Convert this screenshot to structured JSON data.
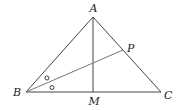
{
  "diagram": {
    "type": "geometry-triangle",
    "colors": {
      "stroke": "#444444",
      "label": "#222222",
      "background": "#ffffff"
    },
    "points": {
      "A": {
        "label": "A",
        "x": 93,
        "y": 17
      },
      "B": {
        "label": "B",
        "x": 26,
        "y": 92
      },
      "C": {
        "label": "C",
        "x": 161,
        "y": 92
      },
      "M": {
        "label": "M",
        "x": 93,
        "y": 92
      },
      "P": {
        "label": "P",
        "x": 123,
        "y": 50
      }
    },
    "segments": [
      "AB",
      "BC",
      "CA",
      "AM",
      "BP"
    ],
    "angle_marks": [
      {
        "vertex": "B",
        "symbol": "circle",
        "between": "AB-BP"
      },
      {
        "vertex": "B",
        "symbol": "circle",
        "between": "BP-BC"
      }
    ]
  }
}
